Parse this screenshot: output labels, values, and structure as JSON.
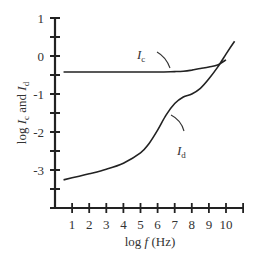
{
  "chart_data": {
    "type": "line",
    "title": "",
    "xlabel": "log f (Hz)",
    "ylabel": "log I_c and I_d",
    "xlim": [
      0,
      11
    ],
    "ylim": [
      -4,
      1
    ],
    "x_ticks": [
      1,
      2,
      3,
      4,
      5,
      6,
      7,
      8,
      9,
      10
    ],
    "y_ticks": [
      1,
      0,
      -1,
      -2,
      -3
    ],
    "grid": false,
    "legend": "none (inline curve labels)",
    "series": [
      {
        "name": "I_c",
        "label_main": "I",
        "label_sub": "c",
        "x": [
          0.5,
          2,
          4,
          6,
          7,
          7.5,
          8,
          8.5,
          9,
          9.5,
          10
        ],
        "y": [
          -0.42,
          -0.42,
          -0.42,
          -0.42,
          -0.41,
          -0.4,
          -0.37,
          -0.33,
          -0.29,
          -0.24,
          -0.1
        ]
      },
      {
        "name": "I_d",
        "label_main": "I",
        "label_sub": "d",
        "x": [
          0.5,
          2,
          3,
          4,
          5,
          5.5,
          6,
          6.5,
          7,
          7.5,
          8,
          8.5,
          9,
          9.5,
          10,
          10.5
        ],
        "y": [
          -3.26,
          -3.1,
          -2.98,
          -2.82,
          -2.55,
          -2.3,
          -1.95,
          -1.55,
          -1.25,
          -1.08,
          -1.0,
          -0.85,
          -0.6,
          -0.3,
          0.05,
          0.39
        ]
      }
    ]
  },
  "labels": {
    "xlabel_prefix": "log ",
    "xlabel_var": "f",
    "xlabel_unit": " (Hz)",
    "ylabel_log": "log ",
    "ylabel_I": "I",
    "ylabel_c": "c",
    "ylabel_and": " and ",
    "ylabel_d": "d"
  }
}
